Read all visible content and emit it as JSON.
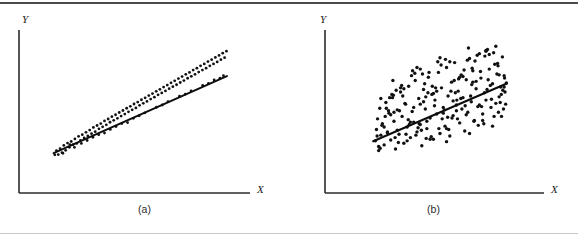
{
  "figure": {
    "background_color": "#ffffff",
    "ink_color": "#111111",
    "rule_top_color": "#4a4a4a",
    "rule_bottom_color": "#c9c9cc"
  },
  "panels": [
    {
      "id": "a",
      "caption": "(a)",
      "x_axis_label": "X",
      "y_axis_label": "Y",
      "axis": {
        "origin_x": 19,
        "origin_y": 193,
        "y_top": 30,
        "x_right": 250
      },
      "regression_line": {
        "x1": 52,
        "y1": 134,
        "x2": 235,
        "y2": 47
      },
      "scatter_band": "narrow",
      "point_count": 120,
      "point_radius": 1.4
    },
    {
      "id": "b",
      "caption": "(b)",
      "x_axis_label": "X",
      "y_axis_label": "Y",
      "axis": {
        "origin_x": 36,
        "origin_y": 193,
        "y_top": 30,
        "x_right": 255
      },
      "regression_line": {
        "x1": 99,
        "y1": 143,
        "x2": 239,
        "y2": 57
      },
      "scatter_band": "wide",
      "point_count": 215,
      "point_radius": 1.7
    }
  ],
  "chart_data": {
    "type": "scatter",
    "title": "",
    "xlabel": "X",
    "ylabel": "Y",
    "grid": false,
    "legend": null,
    "axis_ranges": {
      "x": [
        0,
        10
      ],
      "y": [
        0,
        10
      ]
    },
    "series": [
      {
        "name": "(a) strong linear association",
        "panel": "a",
        "description": "Points cluster tightly in a narrow band about the fitted straight line; high correlation.",
        "fit_line": {
          "slope": 0.63,
          "intercept": 1.5,
          "x_range": [
            1.5,
            9.0
          ]
        },
        "scatter_spread": 0.35,
        "n_points": 120,
        "x": [
          1.55,
          1.62,
          1.7,
          1.78,
          1.86,
          1.94,
          2.02,
          2.1,
          2.18,
          2.26,
          2.34,
          2.42,
          2.5,
          2.58,
          2.66,
          2.74,
          2.82,
          2.9,
          2.98,
          3.06,
          3.14,
          3.22,
          3.3,
          3.38,
          3.46,
          3.54,
          3.62,
          3.7,
          3.78,
          3.86,
          3.94,
          4.02,
          4.1,
          4.18,
          4.26,
          4.34,
          4.42,
          4.5,
          4.58,
          4.66,
          4.74,
          4.82,
          4.9,
          4.98,
          5.06,
          5.14,
          5.22,
          5.3,
          5.38,
          5.46,
          5.54,
          5.62,
          5.7,
          5.78,
          5.86,
          5.94,
          6.02,
          6.1,
          6.18,
          6.26,
          6.34,
          6.42,
          6.5,
          6.58,
          6.66,
          6.74,
          6.82,
          6.9,
          6.98,
          7.06,
          7.14,
          7.22,
          7.3,
          7.38,
          7.46,
          7.54,
          7.62,
          7.7,
          7.78,
          7.86,
          7.94,
          8.02,
          8.1,
          8.18,
          8.26,
          8.34,
          8.42,
          8.5,
          8.58,
          8.66,
          8.74,
          8.82,
          8.9,
          8.98,
          1.9,
          2.4,
          2.95,
          3.45,
          3.95,
          4.45,
          4.95,
          5.45,
          5.95,
          6.45,
          6.95,
          7.45,
          7.95,
          8.45,
          8.85,
          2.2,
          3.2,
          4.2,
          5.2,
          6.2,
          7.2,
          8.2,
          8.7,
          2.7,
          3.7,
          4.7
        ],
        "y": [
          2.34,
          2.6,
          2.36,
          2.72,
          2.48,
          2.92,
          2.62,
          3.06,
          2.8,
          3.16,
          2.96,
          3.32,
          3.04,
          3.48,
          3.22,
          3.58,
          3.38,
          3.72,
          3.5,
          3.86,
          3.64,
          4.02,
          3.76,
          4.14,
          3.94,
          4.26,
          4.06,
          4.42,
          4.18,
          4.54,
          4.34,
          4.68,
          4.46,
          4.8,
          4.58,
          4.94,
          4.72,
          5.06,
          4.84,
          5.2,
          4.98,
          5.32,
          5.1,
          5.46,
          5.22,
          5.58,
          5.38,
          5.72,
          5.5,
          5.84,
          5.62,
          5.98,
          5.76,
          6.1,
          5.88,
          6.24,
          6.02,
          6.36,
          6.14,
          6.5,
          6.26,
          6.62,
          6.4,
          6.76,
          6.52,
          6.88,
          6.64,
          7.02,
          6.78,
          7.14,
          6.9,
          7.28,
          7.04,
          7.4,
          7.16,
          7.54,
          7.28,
          7.66,
          7.42,
          7.8,
          7.54,
          7.92,
          7.66,
          8.06,
          7.8,
          8.18,
          7.92,
          8.32,
          8.04,
          8.44,
          8.18,
          8.58,
          8.3,
          8.7,
          2.44,
          2.8,
          3.22,
          3.58,
          3.9,
          4.26,
          4.58,
          4.92,
          5.26,
          5.6,
          5.94,
          6.26,
          6.6,
          6.94,
          7.2,
          2.96,
          3.42,
          4.08,
          4.74,
          5.4,
          6.06,
          6.72,
          7.04,
          3.04,
          3.68,
          4.32
        ]
      },
      {
        "name": "(b) weak linear association",
        "panel": "b",
        "description": "Points are dispersed over a broad parallelogram-shaped region about the fitted line; low correlation.",
        "fit_line": {
          "slope": 0.58,
          "intercept": 1.9,
          "x_range": [
            2.2,
            8.3
          ]
        },
        "scatter_spread": 1.65,
        "n_points": 215,
        "x": [
          2.3,
          2.35,
          2.4,
          2.45,
          2.5,
          2.55,
          2.62,
          2.7,
          2.78,
          2.85,
          2.92,
          3.0,
          3.08,
          3.15,
          3.22,
          3.3,
          3.38,
          3.45,
          3.52,
          3.6,
          3.68,
          3.75,
          3.82,
          3.9,
          3.98,
          4.05,
          4.12,
          4.2,
          4.28,
          4.35,
          4.42,
          4.5,
          4.58,
          4.65,
          4.72,
          4.8,
          4.88,
          4.95,
          5.02,
          5.1,
          5.18,
          5.25,
          5.32,
          5.4,
          5.48,
          5.55,
          5.62,
          5.7,
          5.78,
          5.85,
          5.92,
          6.0,
          6.08,
          6.15,
          6.22,
          6.3,
          6.38,
          6.45,
          6.52,
          6.6,
          6.68,
          6.75,
          6.82,
          6.9,
          6.98,
          7.05,
          7.12,
          7.2,
          7.28,
          7.35,
          7.42,
          7.5,
          7.58,
          7.65,
          7.72,
          7.8,
          7.88,
          7.95,
          8.02,
          8.1,
          8.18,
          8.25,
          2.6,
          2.9,
          3.2,
          3.5,
          3.8,
          4.1,
          4.4,
          4.7,
          5.0,
          5.3,
          5.6,
          5.9,
          6.2,
          6.5,
          6.8,
          7.1,
          7.4,
          7.7,
          8.0,
          8.2,
          2.45,
          2.75,
          3.05,
          3.35,
          3.65,
          3.95,
          4.25,
          4.55,
          4.85,
          5.15,
          5.45,
          5.75,
          6.05,
          6.35,
          6.65,
          6.95,
          7.25,
          7.55,
          7.85,
          8.15,
          2.55,
          2.85,
          3.15,
          3.45,
          3.75,
          4.05,
          4.35,
          4.65,
          4.95,
          5.25,
          5.55,
          5.85,
          6.15,
          6.45,
          6.75,
          7.05,
          7.35,
          7.65,
          7.95,
          8.22,
          2.7,
          3.1,
          3.4,
          3.7,
          4.0,
          4.3,
          4.6,
          4.9,
          5.2,
          5.5,
          5.8,
          6.1,
          6.4,
          6.7,
          7.0,
          7.3,
          7.6,
          7.9,
          8.12,
          2.8,
          3.3,
          3.6,
          3.9,
          4.2,
          4.5,
          4.8,
          5.1,
          5.4,
          5.7,
          6.0,
          6.3,
          6.6,
          6.9,
          7.2,
          7.5,
          7.8,
          8.05,
          3.0,
          3.55,
          4.15,
          4.75,
          5.35,
          5.95,
          6.55,
          7.15,
          7.75,
          8.28,
          2.38,
          2.95,
          3.85,
          4.45,
          5.05,
          5.65,
          6.25,
          6.85,
          7.45,
          8.06,
          2.52,
          3.25,
          4.35,
          5.55,
          6.72,
          7.92,
          3.12,
          4.62,
          6.02,
          7.35,
          8.18
        ],
        "y": [
          3.2,
          3.9,
          4.55,
          2.85,
          5.2,
          3.55,
          4.25,
          2.95,
          5.55,
          3.7,
          4.9,
          3.25,
          5.85,
          4.4,
          2.7,
          5.1,
          3.6,
          6.2,
          4.7,
          3.05,
          5.45,
          4.05,
          6.55,
          3.4,
          5.0,
          4.35,
          6.9,
          3.75,
          5.8,
          4.2,
          2.9,
          6.35,
          5.15,
          3.95,
          7.1,
          4.6,
          6.05,
          3.3,
          5.7,
          4.85,
          7.4,
          3.65,
          6.45,
          5.25,
          4.1,
          7.7,
          5.95,
          3.5,
          6.8,
          4.75,
          8.0,
          5.4,
          6.25,
          4.3,
          7.25,
          5.85,
          3.8,
          6.95,
          4.95,
          8.25,
          5.6,
          7.5,
          4.45,
          6.4,
          5.3,
          8.55,
          7.05,
          4.85,
          6.15,
          5.7,
          8.8,
          7.6,
          5.25,
          6.7,
          4.7,
          9.0,
          7.95,
          5.9,
          6.5,
          8.35,
          7.2,
          5.45,
          4.15,
          5.05,
          3.4,
          6.6,
          4.5,
          7.35,
          3.85,
          6.15,
          5.35,
          7.85,
          4.65,
          6.9,
          5.8,
          8.15,
          4.4,
          7.45,
          6.35,
          8.6,
          5.55,
          7.05,
          2.6,
          4.7,
          6.05,
          3.1,
          5.5,
          7.2,
          4.0,
          6.7,
          3.45,
          8.05,
          5.1,
          6.25,
          4.55,
          7.55,
          5.95,
          8.45,
          4.25,
          6.6,
          7.3,
          5.15,
          5.8,
          3.75,
          4.95,
          6.45,
          3.2,
          5.25,
          7.6,
          4.4,
          6.1,
          8.3,
          3.95,
          5.65,
          7.1,
          4.8,
          6.8,
          5.4,
          8.7,
          4.1,
          7.25,
          6.2,
          4.05,
          6.9,
          5.05,
          3.6,
          7.5,
          4.25,
          5.9,
          6.55,
          3.95,
          8.2,
          4.6,
          7.0,
          5.35,
          6.65,
          4.15,
          8.4,
          5.75,
          7.8,
          6.3,
          5.2,
          3.85,
          6.4,
          4.35,
          7.7,
          5.6,
          3.3,
          6.25,
          4.9,
          8.05,
          5.05,
          7.15,
          3.65,
          6.85,
          4.45,
          8.5,
          5.5,
          6.05,
          4.8,
          5.95,
          3.55,
          7.4,
          4.55,
          6.15,
          8.9,
          5.3,
          7.9,
          6.75,
          3.5,
          5.85,
          4.2,
          7.3,
          6.45,
          3.9,
          5.15,
          8.1,
          6.95,
          4.7,
          2.75,
          6.3,
          5.45,
          3.15,
          7.65,
          4.95,
          6.0,
          3.35,
          5.7,
          8.75,
          6.5
        ]
      }
    ]
  }
}
